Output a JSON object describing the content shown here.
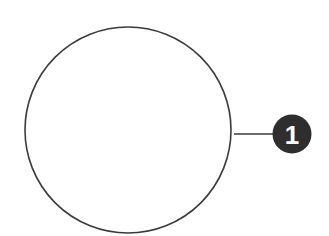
{
  "diagram": {
    "main_circle": {
      "cx": 128,
      "cy": 130,
      "r": 103,
      "stroke": "#3a3a3a",
      "fill": "#ffffff",
      "stroke_width": 1.6
    },
    "connector": {
      "x1": 234,
      "y1": 134,
      "x2": 274,
      "y2": 134,
      "stroke": "#3a3a3a"
    },
    "callout": {
      "cx": 292,
      "cy": 134,
      "r": 19.5,
      "fill": "#2e2e2e",
      "text_color": "#ffffff",
      "label": "1"
    }
  }
}
